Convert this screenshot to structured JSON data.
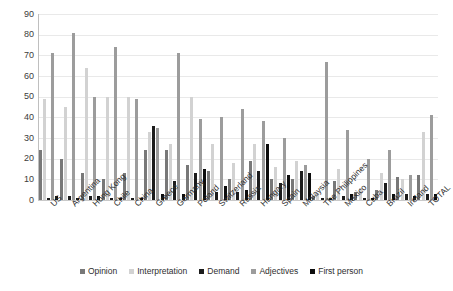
{
  "chart_data": {
    "type": "bar",
    "title": "",
    "xlabel": "",
    "ylabel": "",
    "ylim": [
      0,
      90
    ],
    "yticks": [
      0,
      10,
      20,
      30,
      40,
      50,
      60,
      70,
      80,
      90
    ],
    "grid": true,
    "legend_position": "bottom",
    "categories": [
      "US",
      "Argentina",
      "Hong Kong",
      "Chile",
      "China",
      "Greece",
      "Germany",
      "Poland",
      "Switzerland",
      "Russia",
      "Hungary",
      "Spain",
      "Malaysia",
      "The Philippines",
      "Mexico",
      "Cuba",
      "Brazil",
      "Ireland",
      "TOTAL"
    ],
    "series": [
      {
        "name": "Opinion",
        "color": "#787878",
        "values": [
          24,
          20,
          13,
          10,
          13,
          24,
          24,
          17,
          14,
          10,
          19,
          10,
          10,
          2,
          9,
          4,
          5,
          11,
          12
        ]
      },
      {
        "name": "Interpretation",
        "color": "#d2d2d2",
        "values": [
          49,
          45,
          64,
          50,
          50,
          33,
          27,
          50,
          27,
          18,
          27,
          16,
          19,
          3,
          15,
          6,
          13,
          10,
          33
        ]
      },
      {
        "name": "Demand",
        "color": "#1c1c1c",
        "values": [
          1,
          2,
          2,
          1,
          1,
          36,
          9,
          13,
          4,
          4,
          14,
          8,
          14,
          1,
          2,
          1,
          8,
          3,
          3
        ]
      },
      {
        "name": "Adjectives",
        "color": "#9c9c9c",
        "values": [
          71,
          81,
          50,
          74,
          49,
          35,
          71,
          39,
          40,
          44,
          38,
          30,
          17,
          67,
          34,
          20,
          24,
          12,
          41
        ]
      },
      {
        "name": "First person",
        "color": "#0d0d0d",
        "values": [
          2,
          1,
          2,
          1,
          1,
          3,
          3,
          15,
          7,
          5,
          27,
          12,
          13,
          1,
          3,
          1,
          3,
          2,
          3
        ]
      }
    ]
  }
}
